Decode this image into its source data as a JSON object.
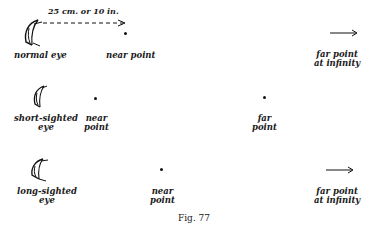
{
  "figure": {
    "caption": "Fig. 77",
    "rows": [
      {
        "id": "normal",
        "eye_label": "normal eye",
        "near_label": "near point",
        "far_label_line1": "far point",
        "far_label_line2": "at infinity",
        "distance_label": "25 cm. or 10 in."
      },
      {
        "id": "short-sighted",
        "eye_label_line1": "short-sighted",
        "eye_label_line2": "eye",
        "near_label_line1": "near",
        "near_label_line2": "point",
        "far_label_line1": "far",
        "far_label_line2": "point"
      },
      {
        "id": "long-sighted",
        "eye_label_line1": "long-sighted",
        "eye_label_line2": "eye",
        "near_label_line1": "near",
        "near_label_line2": "point",
        "far_label_line1": "far point",
        "far_label_line2": "at infinity"
      }
    ]
  },
  "colors": {
    "ink": "#1a1a1a",
    "background": "#ffffff"
  }
}
